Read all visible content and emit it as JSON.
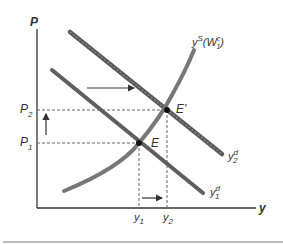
{
  "diagram": {
    "title": "",
    "axes": {
      "y_label": "P",
      "x_label": "y"
    },
    "price_levels": [
      {
        "label": "P",
        "sub": "1"
      },
      {
        "label": "P",
        "sub": "2"
      }
    ],
    "output_levels": [
      {
        "label": "y",
        "sub": "1"
      },
      {
        "label": "y",
        "sub": "2"
      }
    ],
    "points": [
      {
        "label": "E"
      },
      {
        "label": "E'"
      }
    ],
    "curves": {
      "supply": {
        "label": "y",
        "sup": "S",
        "paren_open": "(W",
        "paren_sup": "c",
        "paren_sub": "1",
        "paren_close": ")"
      },
      "demand_1": {
        "label": "y",
        "sup": "d",
        "sub": "1"
      },
      "demand_2": {
        "label": "y",
        "sup": "d",
        "sub": "2"
      }
    },
    "colors": {
      "curve": "#6b6b6b",
      "curve_dark": "#555555",
      "axis": "#333333",
      "dashed": "#666666",
      "separator": "#bdbdbd"
    }
  }
}
